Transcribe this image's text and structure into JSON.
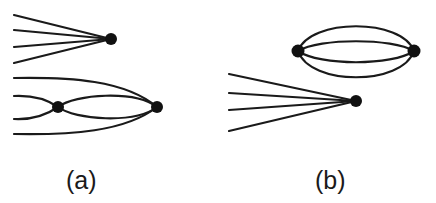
{
  "figure": {
    "panels": [
      {
        "id": "a",
        "label": "(a)",
        "nodes": [
          {
            "name": "fan-vertex",
            "x": 111,
            "y": 39
          },
          {
            "name": "middle-vertex",
            "x": 58,
            "y": 107
          },
          {
            "name": "right-vertex",
            "x": 157,
            "y": 107
          }
        ],
        "description": "Four external legs converging on one vertex; below, two vertices joined by a double arc, with two legs entering the middle vertex and two outer legs entering the right vertex"
      },
      {
        "id": "b",
        "label": "(b)",
        "nodes": [
          {
            "name": "left-vertex",
            "x": 298,
            "y": 51
          },
          {
            "name": "right-vertex",
            "x": 414,
            "y": 51
          },
          {
            "name": "fan-vertex",
            "x": 356,
            "y": 101
          }
        ],
        "description": "Two vertices connected by four arcs (closed vacuum bubble) plus a separate vertex with four external legs"
      }
    ],
    "stroke_color": "#1a1a1a",
    "node_color": "#111111",
    "background": "#ffffff"
  }
}
